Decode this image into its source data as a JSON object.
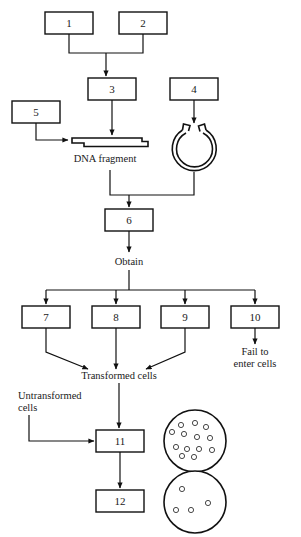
{
  "diagram": {
    "type": "flowchart",
    "boxes": [
      {
        "id": "box-1",
        "label": "1",
        "x": 45,
        "y": 12,
        "w": 48,
        "h": 22
      },
      {
        "id": "box-2",
        "label": "2",
        "x": 119,
        "y": 12,
        "w": 48,
        "h": 22
      },
      {
        "id": "box-3",
        "label": "3",
        "x": 88,
        "y": 78,
        "w": 48,
        "h": 22
      },
      {
        "id": "box-4",
        "label": "4",
        "x": 170,
        "y": 78,
        "w": 48,
        "h": 22
      },
      {
        "id": "box-5",
        "label": "5",
        "x": 12,
        "y": 101,
        "w": 48,
        "h": 22
      },
      {
        "id": "box-6",
        "label": "6",
        "x": 105,
        "y": 209,
        "w": 48,
        "h": 22
      },
      {
        "id": "box-7",
        "label": "7",
        "x": 22,
        "y": 306,
        "w": 48,
        "h": 22
      },
      {
        "id": "box-8",
        "label": "8",
        "x": 92,
        "y": 306,
        "w": 48,
        "h": 22
      },
      {
        "id": "box-9",
        "label": "9",
        "x": 161,
        "y": 306,
        "w": 48,
        "h": 22
      },
      {
        "id": "box-10",
        "label": "10",
        "x": 231,
        "y": 306,
        "w": 48,
        "h": 22
      },
      {
        "id": "box-11",
        "label": "11",
        "x": 96,
        "y": 430,
        "w": 48,
        "h": 22
      },
      {
        "id": "box-12",
        "label": "12",
        "x": 96,
        "y": 490,
        "w": 48,
        "h": 22
      }
    ],
    "labels": [
      {
        "id": "label-dna-fragment",
        "text": "DNA fragment",
        "x": 105,
        "y": 162
      },
      {
        "id": "label-obtain",
        "text": "Obtain",
        "x": 129,
        "y": 265
      },
      {
        "id": "label-transformed",
        "text": "Transformed cells",
        "x": 119,
        "y": 379
      },
      {
        "id": "label-fail-line1",
        "text": "Fail to",
        "x": 255,
        "y": 355
      },
      {
        "id": "label-fail-line2",
        "text": "enter cells",
        "x": 255,
        "y": 367
      },
      {
        "id": "label-untransformed-1",
        "text": "Untransformed",
        "x": 22,
        "y": 399
      },
      {
        "id": "label-untransformed-2",
        "text": "cells",
        "x": 22,
        "y": 411
      }
    ],
    "shapes": [
      {
        "id": "dna-fragment-shape",
        "kind": "sticky-end-dna-duplex"
      },
      {
        "id": "plasmid-shape",
        "kind": "open-circular-plasmid-with-sticky-ends"
      },
      {
        "id": "petri-dish-top",
        "kind": "petri-dish",
        "colonies": 13
      },
      {
        "id": "petri-dish-bottom",
        "kind": "petri-dish",
        "colonies": 4
      }
    ],
    "colors": {
      "background": "#ffffff",
      "stroke": "#111111",
      "text": "#1a1a1a"
    }
  }
}
